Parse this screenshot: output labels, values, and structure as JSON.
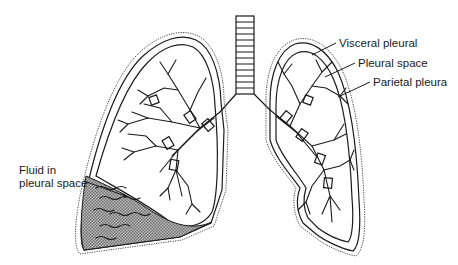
{
  "diagram": {
    "labels": {
      "visceral": "Visceral pleural",
      "pleural_space": "Pleural space",
      "parietal": "Parietal pleura",
      "fluid_line1": "Fluid in",
      "fluid_line2": "pleural space"
    },
    "colors": {
      "line": "#1a1a1a",
      "fluid_fill": "#9a9a9a",
      "background": "#ffffff"
    }
  }
}
